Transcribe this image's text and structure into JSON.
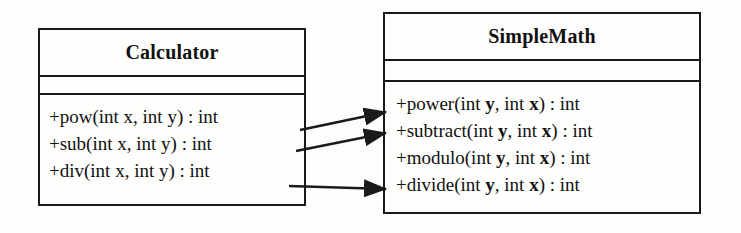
{
  "diagram": {
    "type": "uml-class-diagram",
    "background_color": "#fdfdfb",
    "line_color": "#1a1a1a",
    "text_color": "#111111",
    "classes": [
      {
        "id": "calculator",
        "name": "Calculator",
        "attributes": [],
        "methods": [
          {
            "id": "pow",
            "visibility": "+",
            "signature": "+pow(int x, int y) : int",
            "label_pre": "+pow(int x, int y) : int",
            "bold_params": false
          },
          {
            "id": "sub",
            "visibility": "+",
            "signature": "+sub(int x, int y) : int",
            "label_pre": "+sub(int x, int y) : int",
            "bold_params": false
          },
          {
            "id": "div",
            "visibility": "+",
            "signature": "+div(int x, int y) : int",
            "label_pre": "+div(int x, int y) : int",
            "bold_params": false
          }
        ]
      },
      {
        "id": "simplemath",
        "name": "SimpleMath",
        "attributes": [],
        "methods": [
          {
            "id": "power",
            "visibility": "+",
            "signature": "+power(int y, int x) : int",
            "pre": "+power(int ",
            "p1": "y",
            "mid": ", int ",
            "p2": "x",
            "post": ") : int",
            "bold_params": true
          },
          {
            "id": "subtract",
            "visibility": "+",
            "signature": "+subtract(int y, int x) : int",
            "pre": "+subtract(int ",
            "p1": "y",
            "mid": ", int ",
            "p2": "x",
            "post": ") : int",
            "bold_params": true
          },
          {
            "id": "modulo",
            "visibility": "+",
            "signature": "+modulo(int y, int x) : int",
            "pre": "+modulo(int ",
            "p1": "y",
            "mid": ", int ",
            "p2": "x",
            "post": ") : int",
            "bold_params": true
          },
          {
            "id": "divide",
            "visibility": "+",
            "signature": "+divide(int y, int x) : int",
            "pre": "+divide(int ",
            "p1": "y",
            "mid": ", int ",
            "p2": "x",
            "post": ") : int",
            "bold_params": true
          }
        ]
      }
    ],
    "connections": [
      {
        "id": "pow-to-power",
        "from": "Calculator.pow",
        "to": "SimpleMath.power",
        "style": "solid-arrow",
        "x1": 300,
        "y1": 130,
        "x2": 386,
        "y2": 112
      },
      {
        "id": "sub-to-subtract",
        "from": "Calculator.sub",
        "to": "SimpleMath.subtract",
        "style": "solid-arrow",
        "x1": 296,
        "y1": 151,
        "x2": 386,
        "y2": 133
      },
      {
        "id": "div-to-divide",
        "from": "Calculator.div",
        "to": "SimpleMath.divide",
        "style": "solid-arrow",
        "x1": 289,
        "y1": 186,
        "x2": 386,
        "y2": 189
      }
    ]
  }
}
